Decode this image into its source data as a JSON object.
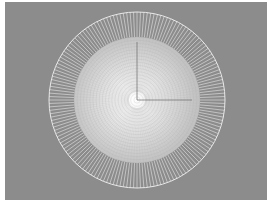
{
  "viewport": {
    "label": "3D viewport",
    "background_color": "#8c8c8c",
    "object": {
      "type": "radial-disc-mesh",
      "outer_ring_radial_segments": 160,
      "inner_dense_grid": true,
      "wire_color": "#e8e8e8",
      "center_glow_color": "#ffffff"
    },
    "gizmo": {
      "axes": [
        "y-axis",
        "x-axis"
      ],
      "axis_color": "#777777"
    }
  }
}
